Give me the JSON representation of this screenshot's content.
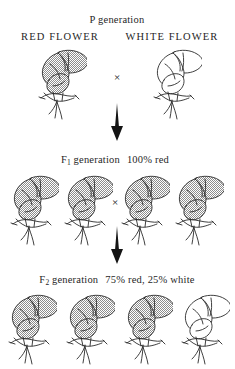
{
  "diagram": {
    "title": "P generation",
    "cross_symbol": "×",
    "generations": [
      {
        "id": "p",
        "heading": "P generation",
        "parent_labels": [
          "RED FLOWER",
          "WHITE FLOWER"
        ],
        "flowers": [
          {
            "phenotype": "red",
            "shaded": true
          },
          {
            "phenotype": "white",
            "shaded": false
          }
        ]
      },
      {
        "id": "f1",
        "heading_main": "F",
        "heading_sub": "1",
        "heading_rest": "generation",
        "ratio": "100% red",
        "flowers": [
          {
            "phenotype": "red",
            "shaded": true
          },
          {
            "phenotype": "red",
            "shaded": true
          },
          {
            "phenotype": "red",
            "shaded": true
          },
          {
            "phenotype": "red",
            "shaded": true
          }
        ]
      },
      {
        "id": "f2",
        "heading_main": "F",
        "heading_sub": "2",
        "heading_rest": "generation",
        "ratio": "75% red, 25% white",
        "flowers": [
          {
            "phenotype": "red",
            "shaded": true
          },
          {
            "phenotype": "red",
            "shaded": true
          },
          {
            "phenotype": "red",
            "shaded": true
          },
          {
            "phenotype": "white",
            "shaded": false
          }
        ]
      }
    ],
    "arrows": [
      {
        "from": "p",
        "to": "f1",
        "direction": "down"
      },
      {
        "from": "f1",
        "to": "f2",
        "direction": "down"
      }
    ],
    "colors": {
      "ink": "#1f1f1f",
      "shading": "#9a9a9a",
      "background": "#ffffff"
    }
  }
}
